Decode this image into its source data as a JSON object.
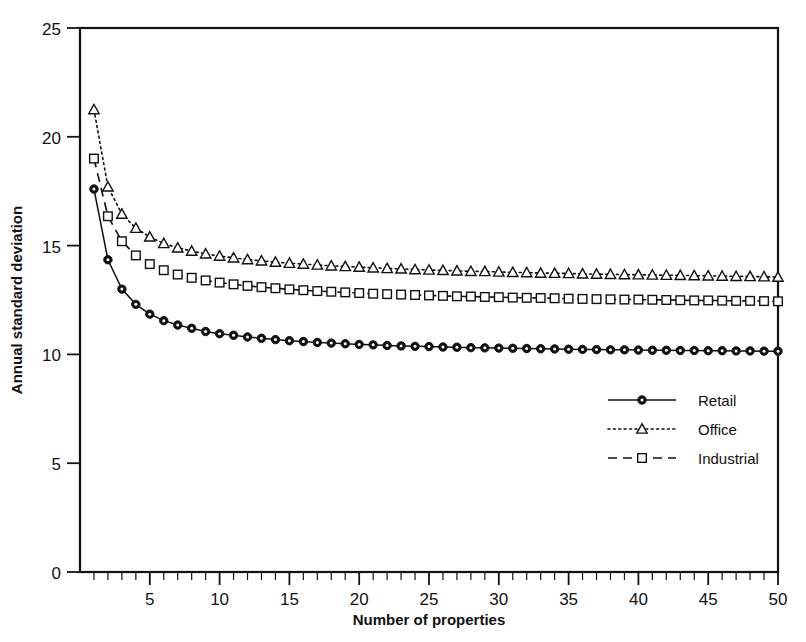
{
  "chart_data": {
    "type": "line",
    "title": "",
    "xlabel": "Number of properties",
    "ylabel": "Annual standard deviation",
    "xlim": [
      0,
      50
    ],
    "ylim": [
      0,
      25
    ],
    "xticks": [
      5,
      10,
      15,
      20,
      25,
      30,
      35,
      40,
      45,
      50
    ],
    "xtick_labels": [
      "5",
      "10",
      "15",
      "20",
      "25",
      "30",
      "35",
      "40",
      "45",
      "50"
    ],
    "xminor_tick_step": 1,
    "yticks": [
      0,
      5,
      10,
      15,
      20,
      25
    ],
    "ytick_labels": [
      "0",
      "5",
      "10",
      "15",
      "20",
      "25"
    ],
    "grid": false,
    "legend_position": "center-right",
    "x": [
      1,
      2,
      3,
      4,
      5,
      6,
      7,
      8,
      9,
      10,
      11,
      12,
      13,
      14,
      15,
      16,
      17,
      18,
      19,
      20,
      21,
      22,
      23,
      24,
      25,
      26,
      27,
      28,
      29,
      30,
      31,
      32,
      33,
      34,
      35,
      36,
      37,
      38,
      39,
      40,
      41,
      42,
      43,
      44,
      45,
      46,
      47,
      48,
      49,
      50
    ],
    "series": [
      {
        "name": "Retail",
        "marker": "filled-circle",
        "linestyle": "solid",
        "color": "#111111",
        "values": [
          17.6,
          14.35,
          13.0,
          12.3,
          11.85,
          11.55,
          11.35,
          11.2,
          11.05,
          10.95,
          10.88,
          10.8,
          10.74,
          10.68,
          10.63,
          10.59,
          10.55,
          10.52,
          10.49,
          10.46,
          10.44,
          10.41,
          10.39,
          10.37,
          10.36,
          10.34,
          10.33,
          10.31,
          10.3,
          10.29,
          10.28,
          10.27,
          10.26,
          10.25,
          10.24,
          10.23,
          10.22,
          10.21,
          10.21,
          10.2,
          10.19,
          10.19,
          10.18,
          10.18,
          10.17,
          10.17,
          10.16,
          10.16,
          10.15,
          10.15
        ]
      },
      {
        "name": "Office",
        "marker": "open-triangle",
        "linestyle": "dotted",
        "color": "#111111",
        "values": [
          21.25,
          17.7,
          16.45,
          15.8,
          15.4,
          15.1,
          14.9,
          14.75,
          14.62,
          14.52,
          14.44,
          14.36,
          14.3,
          14.24,
          14.19,
          14.15,
          14.11,
          14.07,
          14.04,
          14.01,
          13.98,
          13.95,
          13.93,
          13.9,
          13.88,
          13.86,
          13.84,
          13.82,
          13.81,
          13.79,
          13.77,
          13.76,
          13.74,
          13.73,
          13.72,
          13.7,
          13.69,
          13.68,
          13.67,
          13.66,
          13.65,
          13.64,
          13.63,
          13.62,
          13.61,
          13.6,
          13.59,
          13.58,
          13.57,
          13.55
        ]
      },
      {
        "name": "Industrial",
        "marker": "open-square",
        "linestyle": "dashed",
        "color": "#111111",
        "values": [
          19.0,
          16.35,
          15.2,
          14.55,
          14.15,
          13.87,
          13.67,
          13.52,
          13.4,
          13.3,
          13.22,
          13.15,
          13.09,
          13.04,
          12.99,
          12.95,
          12.91,
          12.88,
          12.85,
          12.82,
          12.79,
          12.77,
          12.75,
          12.73,
          12.71,
          12.69,
          12.67,
          12.66,
          12.64,
          12.63,
          12.61,
          12.6,
          12.59,
          12.58,
          12.56,
          12.55,
          12.54,
          12.53,
          12.52,
          12.52,
          12.51,
          12.5,
          12.49,
          12.48,
          12.48,
          12.47,
          12.46,
          12.46,
          12.45,
          12.44
        ]
      }
    ],
    "legend": [
      {
        "label": "Retail",
        "marker": "filled-circle",
        "linestyle": "solid"
      },
      {
        "label": "Office",
        "marker": "open-triangle",
        "linestyle": "dotted"
      },
      {
        "label": "Industrial",
        "marker": "open-square",
        "linestyle": "dashed"
      }
    ]
  }
}
